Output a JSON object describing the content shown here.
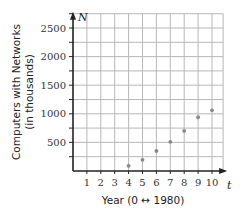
{
  "chart_data": {
    "type": "scatter",
    "title": "",
    "xlabel": "Year (0 ↔ 1980)",
    "ylabel_line1": "Computers with Networks",
    "ylabel_line2": "(in thousands)",
    "x_axis_var": "t",
    "y_axis_var": "N",
    "x_ticks": [
      1,
      2,
      3,
      4,
      5,
      6,
      7,
      8,
      9,
      10
    ],
    "y_ticks": [
      500,
      1000,
      1500,
      2000,
      2500
    ],
    "xlim": [
      0,
      10.8
    ],
    "ylim": [
      0,
      2750
    ],
    "grid": true,
    "grid_x_step": 1,
    "grid_y_step": 250,
    "series": [
      {
        "name": "Computers with Networks",
        "x": [
          4,
          5,
          6,
          7,
          8,
          9,
          10
        ],
        "y": [
          90,
          195,
          350,
          510,
          700,
          940,
          1060
        ]
      }
    ],
    "colors": {
      "grid": "#b8b8b8",
      "axis": "#222222",
      "points": "#888888"
    }
  }
}
